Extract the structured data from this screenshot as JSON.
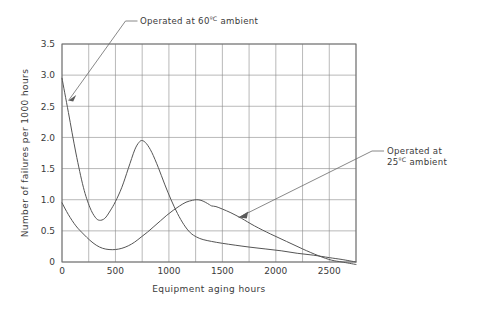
{
  "chart_data": {
    "type": "line",
    "title": "",
    "subtitle": "",
    "xlabel": "Equipment aging hours",
    "ylabel": "Number of failures per 1000 hours",
    "xlim": [
      0,
      2750
    ],
    "ylim": [
      0,
      3.5
    ],
    "xticks": [
      0,
      500,
      1000,
      1500,
      2000,
      2500
    ],
    "xticklabels": [
      "0",
      "500",
      "1000",
      "1500",
      "2000",
      "2500"
    ],
    "yticks": [
      0,
      0.5,
      1.0,
      1.5,
      2.0,
      2.5,
      3.0,
      3.5
    ],
    "yticklabels": [
      "0",
      "0.5",
      "1.0",
      "1.5",
      "2.0",
      "2.5",
      "3.0",
      "3.5"
    ],
    "grid": true,
    "grid_x_step": 250,
    "grid_y_step": 0.5,
    "legend": "annotations",
    "legend_position": "callout-labels",
    "series": [
      {
        "name": "Operated at 60ºC ambient",
        "label_line1": "Operated at  60",
        "label_unit": "ºC",
        "label_line2": " ambient",
        "color": "#555555",
        "x": [
          0,
          60,
          130,
          200,
          260,
          310,
          350,
          400,
          450,
          500,
          560,
          620,
          680,
          720,
          750,
          790,
          840,
          900,
          960,
          1020,
          1080,
          1140,
          1200,
          1260,
          1320,
          1400,
          1500,
          1620,
          1750,
          1900,
          2050,
          2200,
          2350,
          2500,
          2620,
          2750
        ],
        "y": [
          2.95,
          2.4,
          1.75,
          1.2,
          0.88,
          0.72,
          0.67,
          0.7,
          0.82,
          0.97,
          1.2,
          1.5,
          1.8,
          1.92,
          1.95,
          1.9,
          1.76,
          1.52,
          1.25,
          1.0,
          0.78,
          0.6,
          0.47,
          0.4,
          0.36,
          0.33,
          0.3,
          0.27,
          0.24,
          0.21,
          0.18,
          0.14,
          0.11,
          0.07,
          0.04,
          0.0
        ]
      },
      {
        "name": "Operated at 25ºC ambient",
        "label_line1": "Operated at",
        "label_line2_prefix": "25",
        "label_unit": "ºC",
        "label_line2_suffix": " ambient",
        "color": "#555555",
        "x": [
          0,
          60,
          130,
          200,
          260,
          320,
          380,
          440,
          500,
          560,
          620,
          680,
          740,
          800,
          860,
          920,
          980,
          1040,
          1100,
          1160,
          1220,
          1260,
          1300,
          1340,
          1380,
          1400,
          1440,
          1500,
          1580,
          1680,
          1800,
          1950,
          2100,
          2250,
          2400,
          2520,
          2620,
          2750
        ],
        "y": [
          0.95,
          0.76,
          0.58,
          0.45,
          0.35,
          0.27,
          0.22,
          0.2,
          0.2,
          0.22,
          0.26,
          0.32,
          0.4,
          0.48,
          0.57,
          0.66,
          0.75,
          0.83,
          0.9,
          0.96,
          0.99,
          1.0,
          0.99,
          0.96,
          0.92,
          0.9,
          0.89,
          0.85,
          0.79,
          0.7,
          0.58,
          0.45,
          0.33,
          0.21,
          0.1,
          0.03,
          0.0,
          -0.04
        ]
      }
    ],
    "annotations": [
      {
        "name": "annotation-60c",
        "text_prefix": "Operated at  60",
        "text_unit": "ºC",
        "text_suffix": " ambient",
        "target_x": 60,
        "target_y": 2.55
      },
      {
        "name": "annotation-25c",
        "line1": "Operated at",
        "line2_prefix": "25",
        "line2_unit": "ºC",
        "line2_suffix": " ambient",
        "target_x": 1730,
        "target_y": 0.55
      }
    ]
  }
}
